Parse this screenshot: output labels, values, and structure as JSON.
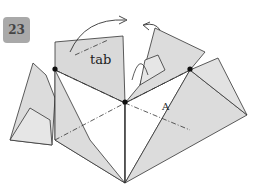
{
  "step": {
    "number": "23"
  },
  "labels": {
    "tab": "tab",
    "point": "A"
  },
  "colors": {
    "paper_shaded": "#dcdcdc",
    "paper_white": "#ffffff",
    "line": "#333333",
    "badge": "#a9a9a9"
  },
  "icons": [
    "fold-arrow-right-icon",
    "fold-arrow-left-icon",
    "pivot-dot-icon"
  ]
}
